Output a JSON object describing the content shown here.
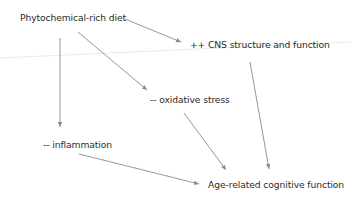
{
  "diagram": {
    "type": "flow",
    "colors": {
      "background": "#ffffff",
      "text": "#2b2b2b",
      "arrow": "#8a8a8a",
      "faint_line": "#e4e4e4"
    },
    "nodes": [
      {
        "id": "diet",
        "label": "Phytochemical-rich diet",
        "x": 20,
        "y": 12
      },
      {
        "id": "cns",
        "label": "++ CNS structure and function",
        "x": 190,
        "y": 39
      },
      {
        "id": "oxidative",
        "label": "-- oxidative stress",
        "x": 150,
        "y": 94
      },
      {
        "id": "inflammation",
        "label": "-- inflammation",
        "x": 43,
        "y": 139
      },
      {
        "id": "cognitive",
        "label": "Age-related cognitive function",
        "x": 208,
        "y": 179
      }
    ],
    "edges": [
      {
        "from": "diet",
        "to": "cns",
        "x1": 125,
        "y1": 19,
        "x2": 181,
        "y2": 42
      },
      {
        "from": "diet",
        "to": "inflammation",
        "x1": 60,
        "y1": 38,
        "x2": 60,
        "y2": 127
      },
      {
        "from": "diet",
        "to": "oxidative",
        "x1": 78,
        "y1": 32,
        "x2": 147,
        "y2": 90
      },
      {
        "from": "cns",
        "to": "cognitive",
        "x1": 250,
        "y1": 62,
        "x2": 269,
        "y2": 169
      },
      {
        "from": "oxidative",
        "to": "cognitive",
        "x1": 184,
        "y1": 113,
        "x2": 226,
        "y2": 170
      },
      {
        "from": "inflammation",
        "to": "cognitive",
        "x1": 79,
        "y1": 154,
        "x2": 199,
        "y2": 184
      }
    ],
    "background_line": {
      "x1": 0,
      "y1": 58,
      "x2": 352,
      "y2": 42
    }
  }
}
